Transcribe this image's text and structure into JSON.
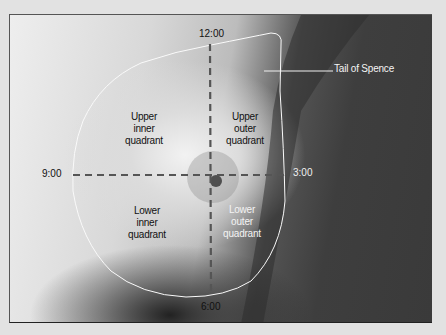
{
  "diagram": {
    "clock_positions": {
      "top": "12:00",
      "right": "3:00",
      "bottom": "6:00",
      "left": "9:00"
    },
    "quadrants": {
      "upper_inner": "Upper\ninner\nquadrant",
      "upper_outer": "Upper\nouter\nquadrant",
      "lower_inner": "Lower\ninner\nquadrant",
      "lower_outer": "Lower\nouter\nquadrant"
    },
    "callout": "Tail of Spence",
    "colors": {
      "outline": "#ffffff",
      "dashed_axes": "#555555",
      "background": "#e2e2e2"
    }
  }
}
